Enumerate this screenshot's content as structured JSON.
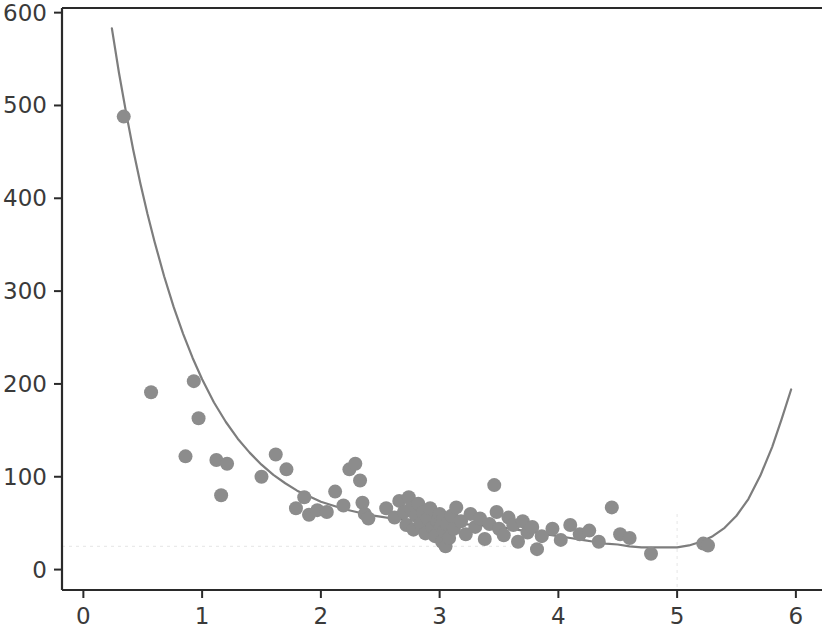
{
  "chart_data": {
    "type": "scatter",
    "title": "",
    "subtitle": "",
    "xlabel": "",
    "ylabel": "",
    "xlim": [
      -0.18,
      6.22
    ],
    "ylim": [
      -22,
      605
    ],
    "xticks": [
      0,
      1,
      2,
      3,
      4,
      5,
      6
    ],
    "xtick_labels": [
      "0",
      "1",
      "2",
      "3",
      "4",
      "5",
      "6"
    ],
    "yticks": [
      0,
      100,
      200,
      300,
      400,
      500,
      600
    ],
    "ytick_labels": [
      "0",
      "100",
      "200",
      "300",
      "400",
      "500",
      "600"
    ],
    "grid": false,
    "legend": null,
    "legend_position": "none",
    "marker_color": "#8c8c8c",
    "marker_size": 14,
    "line_color": "#7d7d7d",
    "line_width": 2.2,
    "reference_color": "#b9b9b9",
    "axis_color": "#2a2a2a",
    "tick_label_color": "#3a3a3a",
    "annotations": [
      {
        "kind": "hline",
        "y": 25,
        "style": "dotted",
        "note": "curve minimum level"
      },
      {
        "kind": "vline",
        "x": 5.0,
        "style": "dotted",
        "note": "curve minimum location"
      }
    ],
    "series": [
      {
        "name": "observations",
        "kind": "scatter",
        "points": [
          [
            0.34,
            488
          ],
          [
            0.57,
            191
          ],
          [
            0.86,
            122
          ],
          [
            0.93,
            203
          ],
          [
            0.97,
            163
          ],
          [
            1.12,
            118
          ],
          [
            1.16,
            80
          ],
          [
            1.21,
            114
          ],
          [
            1.5,
            100
          ],
          [
            1.62,
            124
          ],
          [
            1.71,
            108
          ],
          [
            1.79,
            66
          ],
          [
            1.86,
            78
          ],
          [
            1.9,
            59
          ],
          [
            1.97,
            64
          ],
          [
            2.05,
            62
          ],
          [
            2.12,
            84
          ],
          [
            2.19,
            69
          ],
          [
            2.24,
            108
          ],
          [
            2.29,
            114
          ],
          [
            2.33,
            96
          ],
          [
            2.35,
            72
          ],
          [
            2.37,
            60
          ],
          [
            2.4,
            55
          ],
          [
            2.55,
            66
          ],
          [
            2.62,
            56
          ],
          [
            2.66,
            74
          ],
          [
            2.7,
            62
          ],
          [
            2.72,
            48
          ],
          [
            2.74,
            78
          ],
          [
            2.76,
            66
          ],
          [
            2.78,
            43
          ],
          [
            2.8,
            58
          ],
          [
            2.82,
            71
          ],
          [
            2.84,
            50
          ],
          [
            2.86,
            62
          ],
          [
            2.88,
            39
          ],
          [
            2.9,
            55
          ],
          [
            2.92,
            66
          ],
          [
            2.94,
            45
          ],
          [
            2.96,
            36
          ],
          [
            2.98,
            52
          ],
          [
            3.0,
            60
          ],
          [
            3.01,
            47
          ],
          [
            3.02,
            30
          ],
          [
            3.03,
            55
          ],
          [
            3.04,
            41
          ],
          [
            3.05,
            25
          ],
          [
            3.06,
            49
          ],
          [
            3.08,
            34
          ],
          [
            3.1,
            58
          ],
          [
            3.12,
            44
          ],
          [
            3.14,
            67
          ],
          [
            3.18,
            52
          ],
          [
            3.22,
            38
          ],
          [
            3.26,
            60
          ],
          [
            3.3,
            46
          ],
          [
            3.34,
            55
          ],
          [
            3.38,
            33
          ],
          [
            3.42,
            49
          ],
          [
            3.46,
            91
          ],
          [
            3.48,
            62
          ],
          [
            3.5,
            44
          ],
          [
            3.54,
            37
          ],
          [
            3.58,
            56
          ],
          [
            3.62,
            48
          ],
          [
            3.66,
            30
          ],
          [
            3.7,
            52
          ],
          [
            3.74,
            40
          ],
          [
            3.78,
            46
          ],
          [
            3.82,
            22
          ],
          [
            3.86,
            36
          ],
          [
            3.95,
            44
          ],
          [
            4.02,
            32
          ],
          [
            4.1,
            48
          ],
          [
            4.18,
            38
          ],
          [
            4.26,
            42
          ],
          [
            4.34,
            30
          ],
          [
            4.45,
            67
          ],
          [
            4.52,
            38
          ],
          [
            4.6,
            34
          ],
          [
            4.78,
            17
          ],
          [
            5.22,
            28
          ],
          [
            5.26,
            26
          ]
        ]
      },
      {
        "name": "fitted curve",
        "kind": "line",
        "x_start": 0.24,
        "x_end": 5.96,
        "minimum_x": 5.0,
        "minimum_y": 24,
        "points": [
          [
            0.24,
            583
          ],
          [
            0.3,
            535
          ],
          [
            0.36,
            492
          ],
          [
            0.42,
            452
          ],
          [
            0.48,
            416
          ],
          [
            0.54,
            383
          ],
          [
            0.6,
            353
          ],
          [
            0.68,
            316
          ],
          [
            0.76,
            283
          ],
          [
            0.84,
            254
          ],
          [
            0.92,
            228
          ],
          [
            1.0,
            205
          ],
          [
            1.1,
            180
          ],
          [
            1.2,
            159
          ],
          [
            1.3,
            141
          ],
          [
            1.4,
            126
          ],
          [
            1.5,
            113
          ],
          [
            1.6,
            102
          ],
          [
            1.7,
            93
          ],
          [
            1.8,
            85
          ],
          [
            1.9,
            79
          ],
          [
            2.0,
            73
          ],
          [
            2.1,
            69
          ],
          [
            2.2,
            65
          ],
          [
            2.3,
            62
          ],
          [
            2.4,
            59
          ],
          [
            2.5,
            57
          ],
          [
            2.6,
            55
          ],
          [
            2.7,
            54
          ],
          [
            2.8,
            53
          ],
          [
            2.9,
            52
          ],
          [
            3.0,
            51
          ],
          [
            3.1,
            50
          ],
          [
            3.2,
            49
          ],
          [
            3.3,
            48
          ],
          [
            3.4,
            47
          ],
          [
            3.5,
            46
          ],
          [
            3.6,
            44
          ],
          [
            3.7,
            42
          ],
          [
            3.8,
            40
          ],
          [
            3.9,
            38
          ],
          [
            4.0,
            36
          ],
          [
            4.1,
            34
          ],
          [
            4.2,
            32
          ],
          [
            4.3,
            30
          ],
          [
            4.4,
            28
          ],
          [
            4.5,
            27
          ],
          [
            4.6,
            25
          ],
          [
            4.7,
            24
          ],
          [
            4.8,
            24
          ],
          [
            4.9,
            24
          ],
          [
            5.0,
            24
          ],
          [
            5.1,
            26
          ],
          [
            5.2,
            30
          ],
          [
            5.3,
            36
          ],
          [
            5.4,
            45
          ],
          [
            5.5,
            58
          ],
          [
            5.6,
            76
          ],
          [
            5.7,
            101
          ],
          [
            5.8,
            132
          ],
          [
            5.88,
            162
          ],
          [
            5.96,
            194
          ]
        ]
      }
    ]
  }
}
